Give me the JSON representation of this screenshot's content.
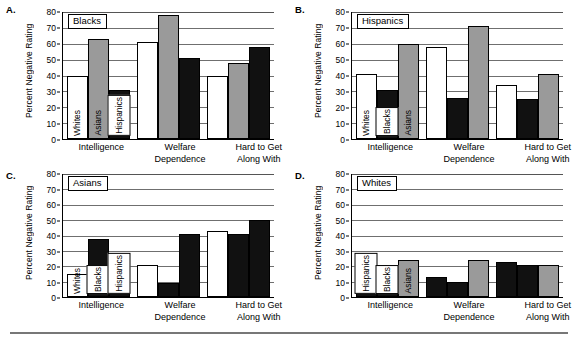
{
  "figure": {
    "ylabel": "Percent Negative Rating",
    "categories": [
      "Intelligence",
      "Welfare\nDependence",
      "Hard to Get\nAlong With"
    ],
    "yticks": [
      "80",
      "70",
      "60",
      "50",
      "40",
      "30",
      "20",
      "10",
      "0"
    ],
    "colors": {
      "white_bar": "#ffffff",
      "gray_bar": "#9a9a9a",
      "black_bar": "#111111",
      "axis": "#000000",
      "gridline": "#6f6f6f"
    }
  },
  "panels": [
    {
      "letter": "A.",
      "title": "Blacks",
      "ylabel": "Percent Negative Rating",
      "series_labels": [
        "Whites",
        "Asians",
        "Hispanics"
      ],
      "series_styles": [
        "white",
        "gray",
        "black"
      ]
    },
    {
      "letter": "B.",
      "title": "Hispanics",
      "ylabel": "Percent Negative Rating",
      "series_labels": [
        "Whites",
        "Blacks",
        "Asians"
      ],
      "series_styles": [
        "white",
        "black",
        "gray"
      ]
    },
    {
      "letter": "C.",
      "title": "Asians",
      "ylabel": "Percent Negative Rating",
      "series_labels": [
        "Whites",
        "Blacks",
        "Hispanics"
      ],
      "series_styles": [
        "white",
        "black",
        "black"
      ]
    },
    {
      "letter": "D.",
      "title": "Whites",
      "ylabel": "Percent Negative Rating",
      "series_labels": [
        "Hispanics",
        "Blacks",
        "Asians"
      ],
      "series_styles": [
        "black",
        "black",
        "gray"
      ]
    }
  ],
  "chart_data": [
    {
      "type": "bar",
      "title": "Blacks",
      "panel": "A.",
      "xlabel": "",
      "ylabel": "Percent Negative Rating",
      "ylim": [
        0,
        80
      ],
      "grid": true,
      "legend_position": "in-bar labels",
      "categories": [
        "Intelligence",
        "Welfare Dependence",
        "Hard to Get Along With"
      ],
      "series": [
        {
          "name": "Whites",
          "style": "white",
          "values": [
            40,
            61,
            40
          ]
        },
        {
          "name": "Asians",
          "style": "gray",
          "values": [
            63,
            78,
            48
          ]
        },
        {
          "name": "Hispanics",
          "style": "black",
          "values": [
            31,
            51,
            58
          ]
        }
      ]
    },
    {
      "type": "bar",
      "title": "Hispanics",
      "panel": "B.",
      "xlabel": "",
      "ylabel": "Percent Negative Rating",
      "ylim": [
        0,
        80
      ],
      "grid": true,
      "legend_position": "in-bar labels",
      "categories": [
        "Intelligence",
        "Welfare Dependence",
        "Hard to Get Along With"
      ],
      "series": [
        {
          "name": "Whites",
          "style": "white",
          "values": [
            41,
            58,
            34
          ]
        },
        {
          "name": "Blacks",
          "style": "black",
          "values": [
            31,
            26,
            25
          ]
        },
        {
          "name": "Asians",
          "style": "gray",
          "values": [
            60,
            71,
            41
          ]
        }
      ]
    },
    {
      "type": "bar",
      "title": "Asians",
      "panel": "C.",
      "xlabel": "",
      "ylabel": "Percent Negative Rating",
      "ylim": [
        0,
        80
      ],
      "grid": true,
      "legend_position": "in-bar labels",
      "categories": [
        "Intelligence",
        "Welfare Dependence",
        "Hard to Get Along With"
      ],
      "series": [
        {
          "name": "Whites",
          "style": "white",
          "values": [
            15,
            21,
            43
          ]
        },
        {
          "name": "Blacks",
          "style": "black",
          "values": [
            38,
            9,
            41
          ]
        },
        {
          "name": "Hispanics",
          "style": "black",
          "values": [
            15,
            41,
            50
          ]
        }
      ]
    },
    {
      "type": "bar",
      "title": "Whites",
      "panel": "D.",
      "xlabel": "",
      "ylabel": "Percent Negative Rating",
      "ylim": [
        0,
        80
      ],
      "grid": true,
      "legend_position": "in-bar labels",
      "categories": [
        "Intelligence",
        "Welfare Dependence",
        "Hard to Get Along With"
      ],
      "series": [
        {
          "name": "Hispanics",
          "style": "black",
          "values": [
            11,
            13,
            23
          ]
        },
        {
          "name": "Blacks",
          "style": "black",
          "values": [
            10,
            10,
            21
          ]
        },
        {
          "name": "Asians",
          "style": "gray",
          "values": [
            24,
            24,
            21
          ]
        }
      ]
    }
  ]
}
